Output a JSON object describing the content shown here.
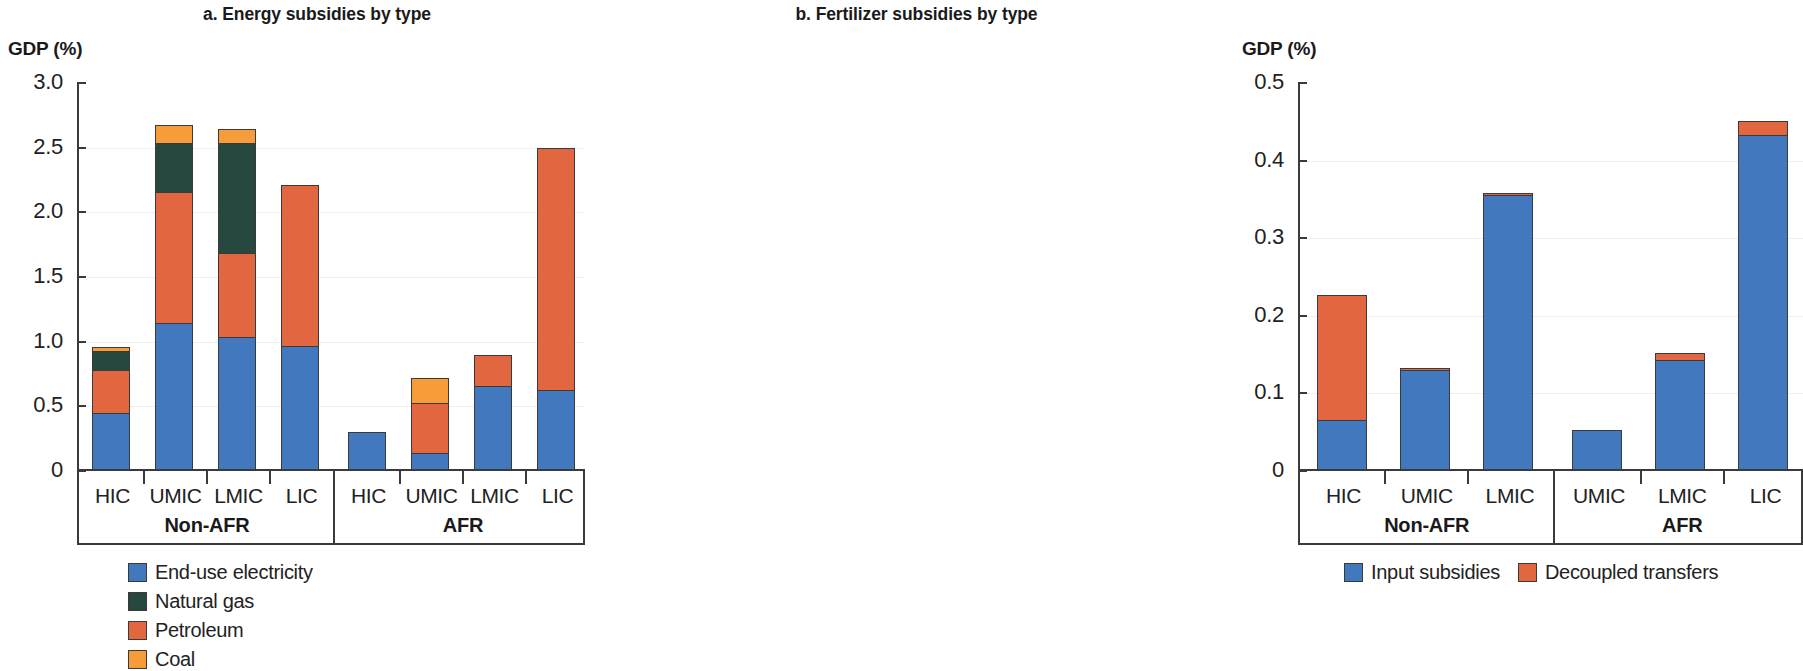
{
  "colors": {
    "electricity_blue": "#4178be",
    "petroleum_red": "#e2663f",
    "natural_gas_green": "#27483e",
    "coal_orange": "#f79c3b",
    "input_blue": "#4178be",
    "decoupled_red": "#e2663f",
    "axis": "#3a3a3a",
    "grid": "#f0eeec"
  },
  "panel_a": {
    "title": "a. Energy subsidies by type",
    "axis_label": "GDP (%)",
    "group_labels": [
      "Non-AFR",
      "AFR"
    ],
    "legend": [
      {
        "label": "End-use electricity",
        "color": "#4178be",
        "name": "end-use-electricity"
      },
      {
        "label": "Natural gas",
        "color": "#27483e",
        "name": "natural-gas"
      },
      {
        "label": "Petroleum",
        "color": "#e2663f",
        "name": "petroleum"
      },
      {
        "label": "Coal",
        "color": "#f79c3b",
        "name": "coal"
      }
    ]
  },
  "panel_b": {
    "title": "b. Fertilizer subsidies by type",
    "axis_label": "GDP (%)",
    "group_labels": [
      "Non-AFR",
      "AFR"
    ],
    "legend": [
      {
        "label": "Input subsidies",
        "color": "#4178be",
        "name": "input-subsidies"
      },
      {
        "label": "Decoupled transfers",
        "color": "#e2663f",
        "name": "decoupled-transfers"
      }
    ]
  },
  "chart_data": [
    {
      "id": "panel_a",
      "type": "bar",
      "subtype": "stacked",
      "title": "a. Energy subsidies by type",
      "xlabel": "",
      "ylabel": "GDP (%)",
      "ylim": [
        0,
        3.0
      ],
      "yticks": [
        "0",
        "0.5",
        "1.0",
        "1.5",
        "2.0",
        "2.5",
        "3.0"
      ],
      "ytick_values": [
        0,
        0.5,
        1.0,
        1.5,
        2.0,
        2.5,
        3.0
      ],
      "grid": true,
      "legend_position": "below",
      "groups": [
        {
          "label": "Non-AFR",
          "categories": [
            "HIC",
            "UMIC",
            "LMIC",
            "LIC"
          ]
        },
        {
          "label": "AFR",
          "categories": [
            "HIC",
            "UMIC",
            "LMIC",
            "LIC"
          ]
        }
      ],
      "categories": [
        "HIC",
        "UMIC",
        "LMIC",
        "LIC",
        "HIC",
        "UMIC",
        "LMIC",
        "LIC"
      ],
      "series": [
        {
          "name": "End-use electricity",
          "color": "#4178be",
          "values": [
            0.43,
            1.13,
            1.02,
            0.95,
            0.285,
            0.12,
            0.64,
            0.61
          ]
        },
        {
          "name": "Petroleum",
          "color": "#e2663f",
          "values": [
            0.34,
            1.02,
            0.66,
            1.25,
            0.0,
            0.4,
            0.25,
            1.88
          ]
        },
        {
          "name": "Natural gas",
          "color": "#27483e",
          "values": [
            0.16,
            0.39,
            0.86,
            0.0,
            0.0,
            0.0,
            0.0,
            0.0
          ]
        },
        {
          "name": "Coal",
          "color": "#f79c3b",
          "values": [
            0.04,
            0.14,
            0.11,
            0.0,
            0.0,
            0.2,
            0.0,
            0.0
          ]
        }
      ],
      "totals": [
        0.97,
        2.68,
        2.65,
        2.2,
        0.285,
        0.72,
        0.89,
        2.49
      ]
    },
    {
      "id": "panel_b",
      "type": "bar",
      "subtype": "stacked",
      "title": "b. Fertilizer subsidies by type",
      "xlabel": "",
      "ylabel": "GDP (%)",
      "ylim": [
        0,
        0.5
      ],
      "yticks": [
        "0",
        "0.1",
        "0.2",
        "0.3",
        "0.4",
        "0.5"
      ],
      "ytick_values": [
        0,
        0.1,
        0.2,
        0.3,
        0.4,
        0.5
      ],
      "grid": true,
      "legend_position": "below",
      "groups": [
        {
          "label": "Non-AFR",
          "categories": [
            "HIC",
            "UMIC",
            "LMIC"
          ]
        },
        {
          "label": "AFR",
          "categories": [
            "UMIC",
            "LMIC",
            "LIC"
          ]
        }
      ],
      "categories": [
        "HIC",
        "UMIC",
        "LMIC",
        "UMIC",
        "LMIC",
        "LIC"
      ],
      "series": [
        {
          "name": "Input subsidies",
          "color": "#4178be",
          "values": [
            0.063,
            0.127,
            0.353,
            0.05,
            0.14,
            0.43
          ]
        },
        {
          "name": "Decoupled transfers",
          "color": "#e2663f",
          "values": [
            0.163,
            0.005,
            0.004,
            0.0,
            0.011,
            0.02
          ]
        }
      ],
      "totals": [
        0.226,
        0.132,
        0.357,
        0.05,
        0.151,
        0.45
      ]
    }
  ]
}
